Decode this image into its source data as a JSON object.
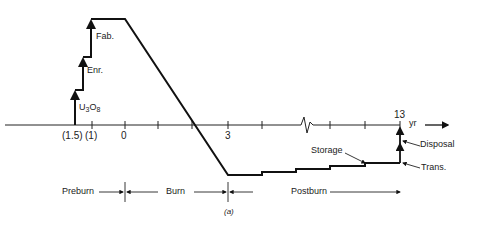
{
  "figure": {
    "caption": "(a)",
    "axis": {
      "unit_label": "yr",
      "tick_labels": [
        {
          "text": "(1.5)",
          "x": 75
        },
        {
          "text": "(1)",
          "x": 92
        },
        {
          "text": "0",
          "x": 125
        },
        {
          "text": "3",
          "x": 228
        },
        {
          "text": "13",
          "x": 400
        }
      ]
    },
    "step_labels": {
      "u3o8_main": "U",
      "u3o8_sub1": "3",
      "u3o8_mid": "O",
      "u3o8_sub2": "8",
      "enrichment": "Enr.",
      "fabrication": "Fab."
    },
    "annotations": {
      "storage": "Storage",
      "disposal": "Disposal",
      "transport": "Trans."
    },
    "phases": {
      "preburn": "Preburn",
      "burn": "Burn",
      "postburn": "Postburn"
    }
  }
}
